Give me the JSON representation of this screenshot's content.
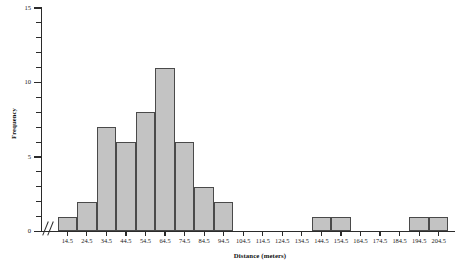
{
  "chart_data": {
    "type": "bar",
    "title": "",
    "subtitle": "",
    "xlabel": "Distance (meters)",
    "ylabel": "Frequency",
    "categories": [
      "14.5",
      "24.5",
      "34.5",
      "44.5",
      "54.5",
      "64.5",
      "74.5",
      "84.5",
      "94.5",
      "104.5",
      "114.5",
      "124.5",
      "134.5",
      "144.5",
      "154.5",
      "164.5",
      "174.5",
      "184.5",
      "194.5",
      "204.5"
    ],
    "values": [
      1,
      2,
      7,
      6,
      8,
      11,
      6,
      3,
      2,
      0,
      0,
      0,
      0,
      1,
      1,
      0,
      0,
      0,
      1,
      1
    ],
    "ylim": [
      0,
      15
    ],
    "y_major_ticks": [
      0,
      5,
      10,
      15
    ],
    "y_major_tick_labels": [
      "0",
      "5",
      "10",
      "15"
    ],
    "y_minor_ticks": [
      1,
      2,
      3,
      4,
      6,
      7,
      8,
      9,
      11,
      12,
      13,
      14
    ],
    "grid": false,
    "legend": "none",
    "bar_fill_color": "#c3c3c3",
    "bar_edge_color": "#4a4a4a",
    "axis_color": "#2b2b2b",
    "axis_break": "//",
    "axis_break_note": "x-axis break symbol before first bin"
  },
  "axes": {
    "y_title": "Frequency",
    "x_title": "Distance (meters)"
  }
}
